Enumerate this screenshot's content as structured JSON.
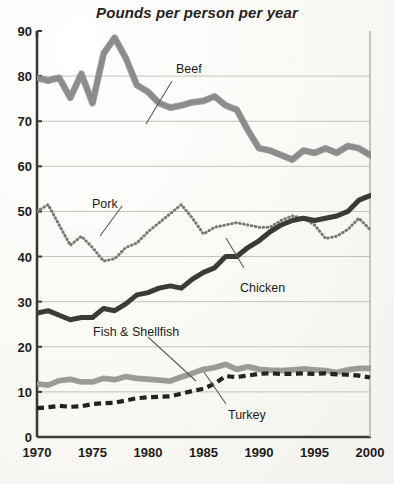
{
  "chart_data": {
    "type": "line",
    "title": "Pounds per person per year",
    "xlabel": "",
    "ylabel": "",
    "xlim": [
      1970,
      2000
    ],
    "ylim": [
      0,
      90
    ],
    "ytick_values": [
      0,
      10,
      20,
      30,
      40,
      50,
      60,
      70,
      80,
      90
    ],
    "ytick_labels": [
      "0",
      "10",
      "20",
      "30",
      "40",
      "50",
      "60",
      "70",
      "80",
      "90"
    ],
    "xtick_values": [
      1970,
      1975,
      1980,
      1985,
      1990,
      1995,
      2000
    ],
    "xtick_labels": [
      "1970",
      "1975",
      "1980",
      "1985",
      "1990",
      "1995",
      "2000"
    ],
    "grid": true,
    "grid_axis": "y",
    "legend": "inline-labels-with-leader-lines",
    "x": [
      1970,
      1971,
      1972,
      1973,
      1974,
      1975,
      1976,
      1977,
      1978,
      1979,
      1980,
      1981,
      1982,
      1983,
      1984,
      1985,
      1986,
      1987,
      1988,
      1989,
      1990,
      1991,
      1992,
      1993,
      1994,
      1995,
      1996,
      1997,
      1998,
      1999,
      2000
    ],
    "series": [
      {
        "name": "Beef",
        "label": "Beef",
        "color": "#8c8c8c",
        "style": "thick-gray-band",
        "values": [
          79.6,
          79.0,
          79.6,
          75.2,
          80.5,
          74.0,
          85.0,
          88.5,
          84.0,
          78.0,
          76.5,
          74.0,
          73.0,
          73.5,
          74.2,
          74.5,
          75.5,
          73.5,
          72.5,
          68.0,
          64.0,
          63.5,
          62.5,
          61.5,
          63.5,
          63.0,
          64.0,
          63.0,
          64.5,
          64.0,
          62.5
        ]
      },
      {
        "name": "Pork",
        "label": "Pork",
        "color": "#7a7a75",
        "style": "dotted",
        "values": [
          50.0,
          51.5,
          47.0,
          42.5,
          44.5,
          42.0,
          39.0,
          39.5,
          42.0,
          43.0,
          45.5,
          47.5,
          49.5,
          51.5,
          48.5,
          45.0,
          46.5,
          47.0,
          47.5,
          47.0,
          46.5,
          46.5,
          48.0,
          49.0,
          48.5,
          47.0,
          44.0,
          44.5,
          46.0,
          48.5,
          46.0
        ]
      },
      {
        "name": "Chicken",
        "label": "Chicken",
        "color": "#3a3a38",
        "style": "thick-solid-dark",
        "values": [
          27.5,
          28.0,
          27.0,
          26.0,
          26.5,
          26.5,
          28.5,
          28.0,
          29.5,
          31.5,
          32.0,
          33.0,
          33.5,
          33.0,
          35.0,
          36.5,
          37.5,
          40.0,
          40.0,
          42.0,
          43.5,
          45.5,
          47.0,
          48.0,
          48.5,
          48.0,
          48.5,
          49.0,
          50.0,
          52.5,
          53.5
        ]
      },
      {
        "name": "Fish & Shellfish",
        "label": "Fish & Shellfish",
        "color": "#9a9a96",
        "style": "medium-gray-band",
        "values": [
          11.8,
          11.5,
          12.5,
          12.8,
          12.2,
          12.2,
          13.0,
          12.7,
          13.4,
          13.0,
          12.8,
          12.6,
          12.4,
          13.3,
          14.1,
          15.0,
          15.4,
          16.1,
          15.0,
          15.6,
          15.0,
          14.8,
          14.7,
          14.9,
          15.1,
          14.9,
          14.7,
          14.3,
          14.9,
          15.2,
          15.2
        ]
      },
      {
        "name": "Turkey",
        "label": "Turkey",
        "color": "#222220",
        "style": "dashed",
        "values": [
          6.4,
          6.6,
          6.9,
          6.7,
          6.8,
          7.3,
          7.5,
          7.6,
          8.1,
          8.6,
          8.8,
          8.9,
          9.0,
          9.6,
          10.2,
          10.7,
          11.8,
          13.5,
          13.3,
          13.6,
          14.0,
          14.1,
          14.0,
          14.0,
          14.1,
          14.0,
          14.1,
          13.9,
          13.8,
          13.6,
          13.2
        ]
      }
    ],
    "annotations": [
      {
        "text": "Beef",
        "x": 1983,
        "y": 82
      },
      {
        "text": "Pork",
        "x": 1974,
        "y": 53
      },
      {
        "text": "Chicken",
        "x": 1989,
        "y": 31
      },
      {
        "text": "Fish & Shellfish",
        "x": 1978,
        "y": 22
      },
      {
        "text": "Turkey",
        "x": 1991,
        "y": 5
      }
    ]
  }
}
